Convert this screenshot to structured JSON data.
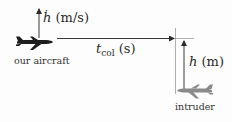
{
  "diagram": {
    "own_aircraft": {
      "label": "our aircraft",
      "color": "#1e1e1e"
    },
    "intruder": {
      "label": "intruder",
      "color": "#8a8a8a"
    },
    "vertical_rate": {
      "symbol": "ḣ",
      "unit": "(m/s)"
    },
    "time_to_collision": {
      "symbol": "t",
      "subscript": "col",
      "unit": "(s)"
    },
    "relative_altitude": {
      "symbol": "h",
      "unit": "(m)"
    },
    "line_color": "#4a4a4a",
    "guide_color": "#9a9a9a"
  }
}
